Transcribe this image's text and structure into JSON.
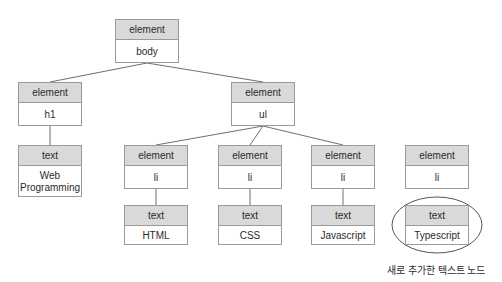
{
  "diagram": {
    "colors": {
      "header_fill": "#d9d9d9",
      "node_border": "#9a9a9a",
      "node_fill": "#ffffff",
      "edge": "#6f6f6f",
      "highlight_ellipse": "#555555",
      "text": "#2b2b2b",
      "background": "#ffffff"
    },
    "nodes": [
      {
        "id": "body",
        "type": "element",
        "label": "body",
        "x": 115,
        "y": 19,
        "w": 64,
        "h": 44
      },
      {
        "id": "h1",
        "type": "element",
        "label": "h1",
        "x": 18,
        "y": 82,
        "w": 64,
        "h": 44
      },
      {
        "id": "ul",
        "type": "element",
        "label": "ul",
        "x": 231,
        "y": 82,
        "w": 64,
        "h": 44
      },
      {
        "id": "h1text",
        "type": "text",
        "label": "Web\nProgramming",
        "x": 18,
        "y": 145,
        "w": 64,
        "h": 52
      },
      {
        "id": "li1",
        "type": "element",
        "label": "li",
        "x": 124,
        "y": 145,
        "w": 64,
        "h": 44
      },
      {
        "id": "li2",
        "type": "element",
        "label": "li",
        "x": 218,
        "y": 145,
        "w": 64,
        "h": 44
      },
      {
        "id": "li3",
        "type": "element",
        "label": "li",
        "x": 311,
        "y": 145,
        "w": 64,
        "h": 44
      },
      {
        "id": "li4",
        "type": "element",
        "label": "li",
        "x": 405,
        "y": 145,
        "w": 64,
        "h": 44
      },
      {
        "id": "text-html",
        "type": "text",
        "label": "HTML",
        "x": 124,
        "y": 205,
        "w": 64,
        "h": 40
      },
      {
        "id": "text-css",
        "type": "text",
        "label": "CSS",
        "x": 218,
        "y": 205,
        "w": 64,
        "h": 40
      },
      {
        "id": "text-js",
        "type": "text",
        "label": "Javascript",
        "x": 311,
        "y": 205,
        "w": 64,
        "h": 40
      },
      {
        "id": "text-ts",
        "type": "text",
        "label": "Typescript",
        "x": 405,
        "y": 205,
        "w": 64,
        "h": 40
      }
    ],
    "edges": [
      {
        "from": "body",
        "to": "h1",
        "x1": 147,
        "y1": 63,
        "x2": 50,
        "y2": 82
      },
      {
        "from": "body",
        "to": "ul",
        "x1": 147,
        "y1": 63,
        "x2": 263,
        "y2": 82
      },
      {
        "from": "h1",
        "to": "h1text",
        "x1": 50,
        "y1": 126,
        "x2": 50,
        "y2": 145
      },
      {
        "from": "ul",
        "to": "li1",
        "x1": 263,
        "y1": 126,
        "x2": 156,
        "y2": 145
      },
      {
        "from": "ul",
        "to": "li2",
        "x1": 263,
        "y1": 126,
        "x2": 250,
        "y2": 145
      },
      {
        "from": "ul",
        "to": "li3",
        "x1": 263,
        "y1": 126,
        "x2": 343,
        "y2": 145
      },
      {
        "from": "li1",
        "to": "text-html",
        "x1": 156,
        "y1": 189,
        "x2": 156,
        "y2": 205
      },
      {
        "from": "li2",
        "to": "text-css",
        "x1": 250,
        "y1": 189,
        "x2": 250,
        "y2": 205
      },
      {
        "from": "li3",
        "to": "text-js",
        "x1": 343,
        "y1": 189,
        "x2": 343,
        "y2": 205
      }
    ],
    "highlight": {
      "shape": "ellipse",
      "cx": 437,
      "cy": 225,
      "rx": 45,
      "ry": 28
    },
    "annotation": {
      "text": "새로 추가한 텍스트 노드",
      "x": 387,
      "y": 262
    }
  }
}
